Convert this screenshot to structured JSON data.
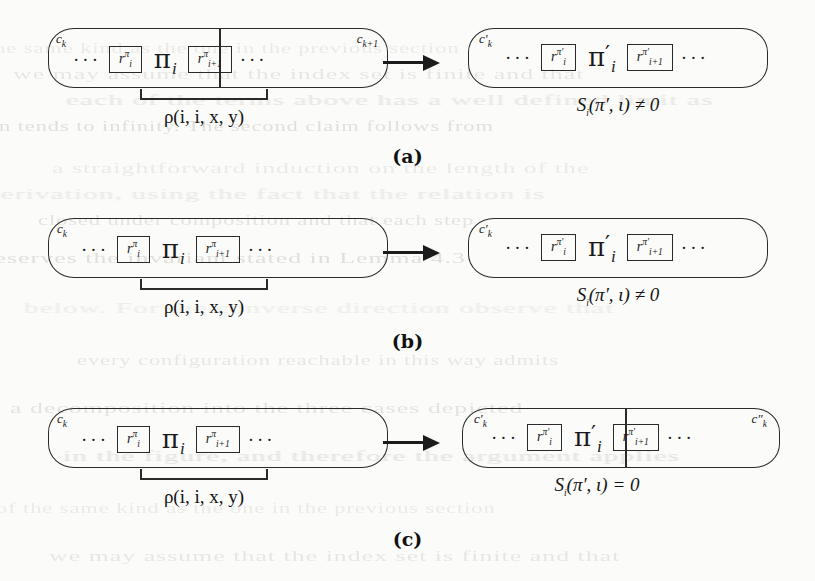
{
  "figure": {
    "kind": "diagram",
    "arrow_glyph": "→",
    "ellipsis": "···"
  },
  "panels": [
    {
      "id": "a",
      "label": "(a)",
      "left": {
        "containers": [
          {
            "tag_base": "c",
            "tag_sub": "k",
            "tag_prime": ""
          },
          {
            "tag_base": "c",
            "tag_sub": "k+1",
            "tag_prime": ""
          }
        ],
        "split": true,
        "tokens": {
          "lead_ellipsis": "···",
          "left_cell": {
            "base": "r",
            "sub": "i",
            "sup": "π"
          },
          "center": {
            "base": "π",
            "sub": "i",
            "prime": ""
          },
          "right_cell": {
            "base": "r",
            "sub": "i+1",
            "sup": "π"
          },
          "trail_ellipsis": "···"
        },
        "brace_caption": "ρ(i, i, x, y)"
      },
      "right": {
        "containers": [
          {
            "tag_base": "c",
            "tag_sub": "k",
            "tag_prime": "′"
          }
        ],
        "split": false,
        "tokens": {
          "lead_ellipsis": "···",
          "left_cell": {
            "base": "r",
            "sub": "i",
            "sup": "π′"
          },
          "center": {
            "base": "π",
            "sub": "i",
            "prime": "′"
          },
          "right_cell": {
            "base": "r",
            "sub": "i+1",
            "sup": "π′"
          },
          "trail_ellipsis": "···"
        },
        "condition": "Sᵢ(π′, ι) ≠ 0"
      }
    },
    {
      "id": "b",
      "label": "(b)",
      "left": {
        "containers": [
          {
            "tag_base": "c",
            "tag_sub": "k",
            "tag_prime": ""
          }
        ],
        "split": false,
        "tokens": {
          "lead_ellipsis": "···",
          "left_cell": {
            "base": "r",
            "sub": "i",
            "sup": "π"
          },
          "center": {
            "base": "π",
            "sub": "i",
            "prime": ""
          },
          "right_cell": {
            "base": "r",
            "sub": "i+1",
            "sup": "π"
          },
          "trail_ellipsis": "···"
        },
        "brace_caption": "ρ(i, i, x, y)"
      },
      "right": {
        "containers": [
          {
            "tag_base": "c",
            "tag_sub": "k",
            "tag_prime": "′"
          }
        ],
        "split": false,
        "tokens": {
          "lead_ellipsis": "···",
          "left_cell": {
            "base": "r",
            "sub": "i",
            "sup": "π′"
          },
          "center": {
            "base": "π",
            "sub": "i",
            "prime": "′"
          },
          "right_cell": {
            "base": "r",
            "sub": "i+1",
            "sup": "π′"
          },
          "trail_ellipsis": "···"
        },
        "condition": "Sᵢ(π′, ι) ≠ 0"
      }
    },
    {
      "id": "c",
      "label": "(c)",
      "left": {
        "containers": [
          {
            "tag_base": "c",
            "tag_sub": "k",
            "tag_prime": ""
          }
        ],
        "split": false,
        "tokens": {
          "lead_ellipsis": "···",
          "left_cell": {
            "base": "r",
            "sub": "i",
            "sup": "π"
          },
          "center": {
            "base": "π",
            "sub": "i",
            "prime": ""
          },
          "right_cell": {
            "base": "r",
            "sub": "i+1",
            "sup": "π"
          },
          "trail_ellipsis": "···"
        },
        "brace_caption": "ρ(i, i, x, y)"
      },
      "right": {
        "containers": [
          {
            "tag_base": "c",
            "tag_sub": "k",
            "tag_prime": "′"
          },
          {
            "tag_base": "c",
            "tag_sub": "k",
            "tag_prime": "″"
          }
        ],
        "split": true,
        "tokens": {
          "lead_ellipsis": "···",
          "left_cell": {
            "base": "r",
            "sub": "i",
            "sup": "π′"
          },
          "center": {
            "base": "π",
            "sub": "i",
            "prime": "′"
          },
          "right_cell": {
            "base": "r",
            "sub": "i+1",
            "sup": "π′"
          },
          "trail_ellipsis": "···"
        },
        "condition": "Sᵢ(π′, ι) = 0"
      }
    }
  ],
  "background_ghost_lines": [
    "of the same kind as the one in the previous section",
    "we may assume that the index set is finite and that",
    "each of the terms above has a well defined limit as",
    "n tends to infinity. The second claim follows from",
    "a straightforward induction on the length of the",
    "derivation, using the fact that the relation is",
    "closed under composition and that each step",
    "preserves the invariant stated in Lemma 4.3",
    "below. For the converse direction observe that",
    "every configuration reachable in this way admits",
    "a decomposition into the three cases depicted",
    "in the figure, and therefore the argument applies"
  ]
}
